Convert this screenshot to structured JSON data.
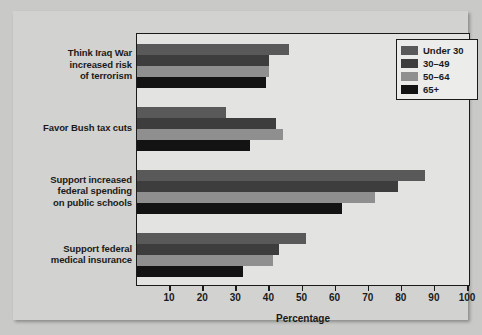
{
  "chart_data": {
    "type": "bar",
    "orientation": "horizontal",
    "title": "",
    "xlabel": "Percentage",
    "ylabel": "",
    "xlim": [
      0,
      100
    ],
    "xticks": [
      10,
      20,
      30,
      40,
      50,
      60,
      70,
      80,
      90,
      100
    ],
    "grid": false,
    "legend_position": "top-right",
    "categories": [
      "Think Iraq War increased risk of terrorism",
      "Favor Bush tax cuts",
      "Support increased federal spending on public schools",
      "Support federal medical insurance"
    ],
    "category_lines": [
      [
        "Think Iraq War",
        "increased risk",
        "of terrorism"
      ],
      [
        "Favor Bush tax cuts"
      ],
      [
        "Support increased",
        "federal spending",
        "on public schools"
      ],
      [
        "Support federal",
        "medical insurance"
      ]
    ],
    "series": [
      {
        "name": "Under 30",
        "color": "#595959",
        "values": [
          46,
          27,
          87,
          51
        ]
      },
      {
        "name": "30–49",
        "color": "#3d3d3d",
        "values": [
          40,
          42,
          79,
          43
        ]
      },
      {
        "name": "50–64",
        "color": "#8f8f8f",
        "values": [
          40,
          44,
          72,
          41
        ]
      },
      {
        "name": "65+",
        "color": "#131313",
        "values": [
          39,
          34,
          62,
          32
        ]
      }
    ]
  },
  "axis": {
    "title": "Percentage"
  },
  "legend": {
    "entries": [
      {
        "label": "Under 30",
        "color": "#595959"
      },
      {
        "label": "30–49",
        "color": "#3d3d3d"
      },
      {
        "label": "50–64",
        "color": "#8f8f8f"
      },
      {
        "label": "65+",
        "color": "#131313"
      }
    ]
  },
  "colors": {
    "background": "#c9c9c7",
    "panel": "#d2d2d0",
    "plot_background": "#e3e3e1",
    "frame": "#1a1a1a",
    "text": "#1a1a1a"
  }
}
